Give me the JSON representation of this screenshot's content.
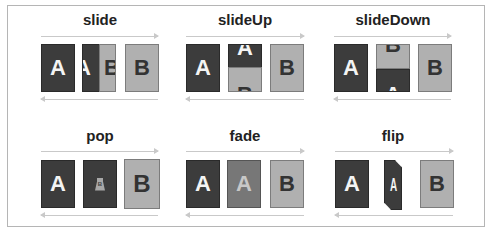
{
  "colors": {
    "page_a": "#3c3c3c",
    "page_b": "#b0b0b0",
    "fade_mid": "#777777",
    "arrow": "#c9c9c9",
    "frame_border": "#b5b5b5"
  },
  "panels": [
    {
      "title": "slide",
      "from": "A",
      "to": "B",
      "mid_left": "A",
      "mid_right": "B"
    },
    {
      "title": "slideUp",
      "from": "A",
      "to": "B",
      "mid_top": "A",
      "mid_bottom": "B"
    },
    {
      "title": "slideDown",
      "from": "A",
      "to": "B",
      "mid_top": "B",
      "mid_bottom": "A"
    },
    {
      "title": "pop",
      "from": "A",
      "to": "B",
      "mid_small": "B"
    },
    {
      "title": "fade",
      "from": "A",
      "to": "B",
      "mid": "A"
    },
    {
      "title": "flip",
      "from": "A",
      "to": "B",
      "mid": "A"
    }
  ]
}
